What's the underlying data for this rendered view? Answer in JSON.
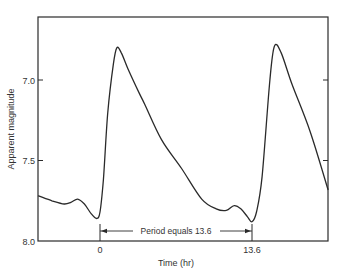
{
  "chart_data": {
    "type": "line",
    "title": "",
    "xlabel": "Time (hr)",
    "ylabel": "Apparent magnitude",
    "y_inverted": true,
    "xlim": [
      -5.5,
      20.4
    ],
    "ylim": [
      8.0,
      6.61
    ],
    "x_ticks": [
      {
        "value": 0,
        "label": "0"
      },
      {
        "value": 13.6,
        "label": "13.6"
      }
    ],
    "y_ticks": [
      {
        "value": 7.0,
        "label": "7.0"
      },
      {
        "value": 7.5,
        "label": "7.5"
      },
      {
        "value": 8.0,
        "label": "8.0"
      }
    ],
    "grid": false,
    "legend": null,
    "annotation": {
      "text": "Period equals 13.6",
      "from_x": 0,
      "to_x": 13.6,
      "y": 7.94
    },
    "series": [
      {
        "name": "light curve",
        "x": [
          -5.5,
          -4.3,
          -3.2,
          -2.6,
          -2.0,
          -1.4,
          -0.8,
          -0.3,
          0.0,
          0.3,
          0.7,
          1.2,
          1.5,
          1.9,
          2.5,
          3.5,
          4.0,
          5.5,
          7.3,
          9.1,
          10.4,
          11.3,
          12.0,
          12.6,
          13.2,
          13.6,
          14.0,
          14.5,
          15.2,
          15.6,
          16.2,
          17.2,
          18.8,
          20.4
        ],
        "y": [
          7.72,
          7.75,
          7.77,
          7.76,
          7.74,
          7.77,
          7.83,
          7.86,
          7.82,
          7.62,
          7.2,
          6.9,
          6.8,
          6.83,
          6.93,
          7.08,
          7.15,
          7.37,
          7.55,
          7.74,
          7.8,
          7.81,
          7.78,
          7.8,
          7.85,
          7.88,
          7.82,
          7.6,
          7.0,
          6.79,
          6.83,
          7.03,
          7.32,
          7.68
        ]
      }
    ],
    "derived": {
      "period_hr": 13.6,
      "max_brightness_mag": 6.79,
      "min_brightness_mag": 7.88,
      "amplitude_mag": 1.09
    }
  }
}
